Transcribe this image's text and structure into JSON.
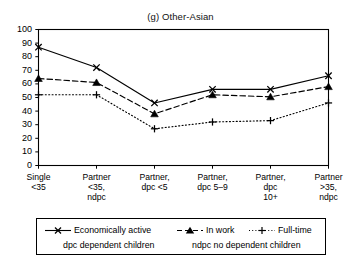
{
  "chart_data": {
    "type": "line",
    "title": "(g) Other-Asian",
    "xlabel": "",
    "ylabel": "",
    "ylim": [
      0,
      100
    ],
    "yticks": [
      0,
      10,
      20,
      30,
      40,
      50,
      60,
      70,
      80,
      90,
      100
    ],
    "grid": false,
    "legend_position": "below-plot",
    "categories": [
      "Single\n<35",
      "Partner\n<35,\nndpc",
      "Partner,\ndpc <5",
      "Partner,\ndpc 5–9",
      "Partner,\ndpc\n10+",
      "Partner\n>35,\nndpc"
    ],
    "category_lines": [
      [
        "Single",
        "<35"
      ],
      [
        "Partner",
        "<35,",
        "ndpc"
      ],
      [
        "Partner,",
        "dpc <5"
      ],
      [
        "Partner,",
        "dpc 5–9"
      ],
      [
        "Partner,",
        "dpc",
        "10+"
      ],
      [
        "Partner",
        ">35,",
        "ndpc"
      ]
    ],
    "series": [
      {
        "name": "Economically active",
        "marker": "x",
        "line_style": "solid",
        "color": "#000000",
        "values": [
          87,
          72,
          46,
          56,
          56,
          66
        ]
      },
      {
        "name": "In work",
        "marker": "triangle",
        "line_style": "dashed",
        "color": "#000000",
        "values": [
          64,
          61,
          38,
          52,
          50.5,
          58
        ]
      },
      {
        "name": "Full-time",
        "marker": "plus",
        "line_style": "dotted",
        "color": "#000000",
        "values": [
          52,
          52,
          27,
          32,
          33,
          46
        ]
      }
    ],
    "notes": [
      "dpc  dependent children",
      "ndpc  no dependent children"
    ]
  },
  "legend": {
    "items": [
      {
        "label": "Economically active"
      },
      {
        "label": "In work"
      },
      {
        "label": "Full-time"
      }
    ],
    "note_dpc": "dpc  dependent children",
    "note_ndpc": "ndpc  no dependent children"
  }
}
